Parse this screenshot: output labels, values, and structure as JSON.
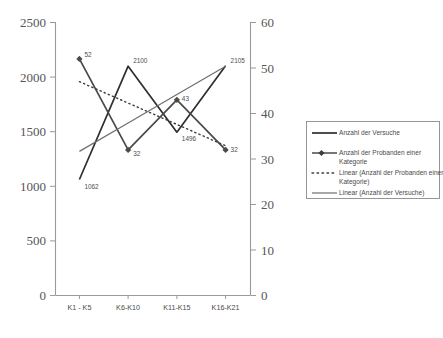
{
  "chart_data": {
    "type": "line",
    "title": "",
    "subtitle": "",
    "xlabel": "",
    "ylabel": "",
    "grid": false,
    "legend_position": "right",
    "categories": [
      "K1 - K5",
      "K6-K10",
      "K11-K15",
      "K16-K21"
    ],
    "axes": {
      "left": {
        "label": "",
        "min": 0,
        "max": 2500,
        "step": 500,
        "ticks": [
          "0",
          "500",
          "1000",
          "1500",
          "2000",
          "2500"
        ]
      },
      "right": {
        "label": "",
        "min": 0,
        "max": 60,
        "step": 10,
        "ticks": [
          "0",
          "10",
          "20",
          "30",
          "40",
          "50",
          "60"
        ]
      }
    },
    "series": [
      {
        "name": "Anzahl der Versuche",
        "axis": "left",
        "style": "solid",
        "marker": "none",
        "color": "#2e2e2e",
        "values": [
          1062,
          2100,
          1496,
          2105
        ],
        "point_labels": [
          "1062",
          "2100",
          "1496",
          "2105"
        ]
      },
      {
        "name": "Anzahl der Probanden einer Kategorie",
        "axis": "right",
        "style": "solid",
        "marker": "diamond",
        "color": "#4a4a4a",
        "values": [
          52,
          32,
          43,
          32
        ],
        "point_labels": [
          "52",
          "32",
          "43",
          "32"
        ]
      },
      {
        "name": "Linear (Anzahl der Probanden einer Kategorie)",
        "axis": "right",
        "style": "dotted",
        "marker": "none",
        "color": "#3d3d3d",
        "trendline_of": "Anzahl der Probanden einer Kategorie",
        "values": [
          47.0,
          42.3,
          37.6,
          32.9
        ],
        "point_labels": []
      },
      {
        "name": "Linear (Anzahl der Versuche)",
        "axis": "left",
        "style": "solid",
        "marker": "none",
        "color": "#6e6e6e",
        "trendline_of": "Anzahl der Versuche",
        "values": [
          1320,
          1580,
          1840,
          2100
        ],
        "point_labels": []
      }
    ]
  },
  "legend": {
    "items": [
      {
        "label": "Anzahl der Versuche",
        "label2": ""
      },
      {
        "label": "Anzahl der Probanden einer",
        "label2": "Kategorie"
      },
      {
        "label": "Linear (Anzahl der Probanden einer",
        "label2": "Kategorie)"
      },
      {
        "label": "Linear (Anzahl der Versuche)",
        "label2": ""
      }
    ]
  }
}
